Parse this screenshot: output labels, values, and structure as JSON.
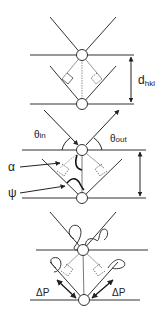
{
  "diagram": {
    "colors": {
      "stroke": "#333333",
      "light_stroke": "#777777",
      "atom_fill": "#ffffff",
      "background": "#ffffff"
    },
    "panels": [
      {
        "id": "top",
        "description": "Two lattice planes separated by d_hkl, reflection geometry",
        "labels": {
          "spacing": "d",
          "spacing_sub": "hkl"
        }
      },
      {
        "id": "middle",
        "description": "Incident and outgoing beams with angles",
        "labels": {
          "theta_in": "θ",
          "theta_in_sub": "in",
          "theta_out": "θ",
          "theta_out_sub": "out",
          "alpha": "α",
          "psi": "ψ"
        }
      },
      {
        "id": "bottom",
        "description": "Polarized waves with path difference",
        "labels": {
          "delta_p_left": "ΔP",
          "delta_p_right": "ΔP"
        }
      }
    ]
  }
}
